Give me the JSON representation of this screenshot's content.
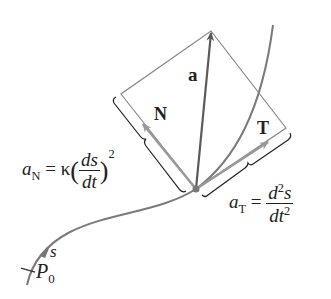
{
  "diagram": {
    "colors": {
      "curve": "#7a7a7a",
      "vector_a": "#5a5a5a",
      "unit_vectors": "#9a9a9a",
      "rectangle": "#888888",
      "text": "#222222"
    },
    "labels": {
      "a": "a",
      "N": "N",
      "T": "T",
      "s": "s",
      "P0_main": "P",
      "P0_sub": "0",
      "aN_main": "a",
      "aN_sub": "N",
      "aN_eq": "= κ",
      "aN_frac_num": "ds",
      "aN_frac_den": "dt",
      "aN_exp": "2",
      "aT_main": "a",
      "aT_sub": "T",
      "aT_eq": "=",
      "aT_frac_num_d": "d",
      "aT_frac_num_exp": "2",
      "aT_frac_num_s": "s",
      "aT_frac_den_dt": "dt",
      "aT_frac_den_exp": "2"
    }
  }
}
